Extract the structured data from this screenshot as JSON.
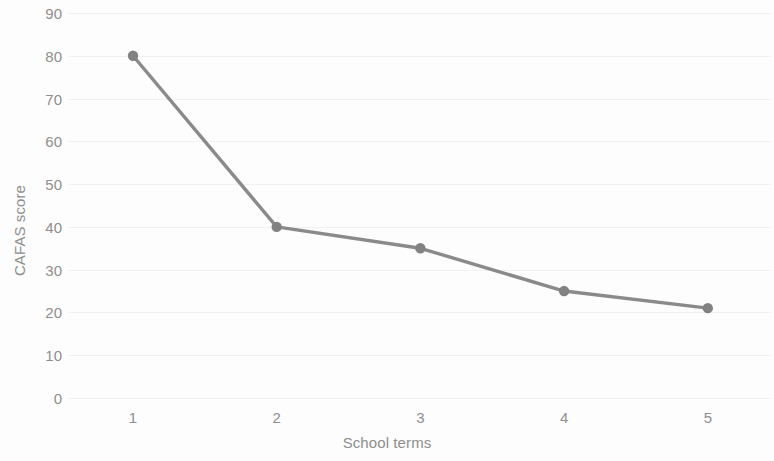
{
  "chart_data": {
    "type": "line",
    "title": "",
    "xlabel": "School terms",
    "ylabel": "CAFAS score",
    "categories": [
      "1",
      "2",
      "3",
      "4",
      "5"
    ],
    "x": [
      1,
      2,
      3,
      4,
      5
    ],
    "values": [
      80,
      40,
      35,
      25,
      21
    ],
    "series": [
      {
        "name": "CAFAS score",
        "values": [
          80,
          40,
          35,
          25,
          21
        ]
      }
    ],
    "ylim": [
      0,
      90
    ],
    "xlim": [
      0.5,
      5.5
    ],
    "y_ticks": [
      0,
      10,
      20,
      30,
      40,
      50,
      60,
      70,
      80,
      90
    ],
    "y_tick_labels": [
      "0",
      "10",
      "20",
      "30",
      "40",
      "50",
      "60",
      "70",
      "80",
      "90"
    ],
    "x_tick_labels": [
      "1",
      "2",
      "3",
      "4",
      "5"
    ],
    "grid": true,
    "grid_axis": "y",
    "legend": false,
    "legend_position": "none",
    "markers": true,
    "marker_shape": "circle",
    "colors": {
      "line": "#8a8a8a",
      "marker": "#828282",
      "gridline": "#f0f0f0",
      "tick_label": "#8e8e8e",
      "axis_title": "#8e8e8e",
      "background": "#fdfdfd"
    }
  }
}
